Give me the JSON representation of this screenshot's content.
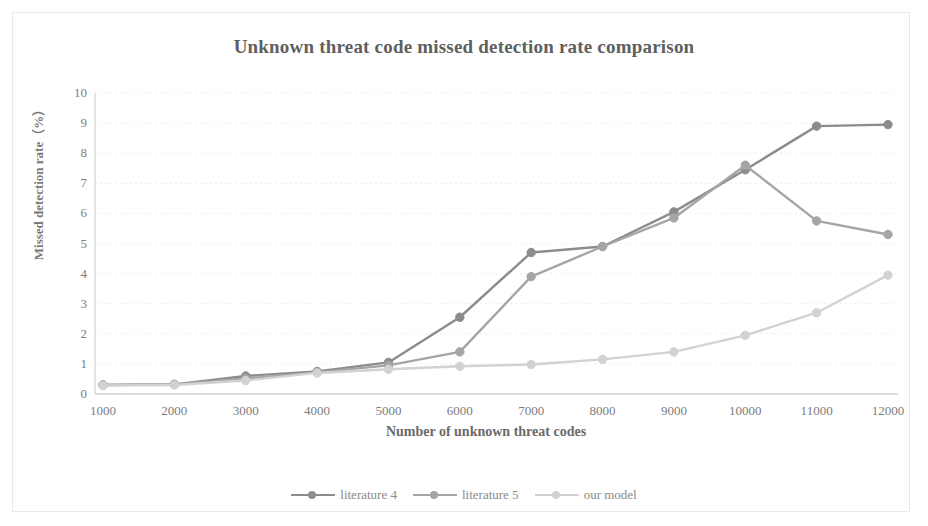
{
  "chart_data": {
    "type": "line",
    "title": "Unknown threat code missed detection rate comparison",
    "xlabel": "Number of unknown threat codes",
    "ylabel": "Missed detection rate（%）",
    "categories": [
      1000,
      2000,
      3000,
      4000,
      5000,
      6000,
      7000,
      8000,
      9000,
      10000,
      11000,
      12000
    ],
    "x_tick_labels": [
      "1000",
      "2000",
      "3000",
      "4000",
      "5000",
      "6000",
      "7000",
      "8000",
      "9000",
      "10000",
      "11000",
      "12000"
    ],
    "y_tick_labels": [
      "0",
      "1",
      "2",
      "3",
      "4",
      "5",
      "6",
      "7",
      "8",
      "9",
      "10"
    ],
    "xlim": [
      1000,
      12000
    ],
    "ylim": [
      0,
      10
    ],
    "grid": true,
    "grid_axis": "y",
    "legend_position": "bottom",
    "series": [
      {
        "name": "literature 4",
        "color": "#8c8c8c",
        "values": [
          0.3,
          0.32,
          0.6,
          0.75,
          1.05,
          2.55,
          4.7,
          4.9,
          6.05,
          7.45,
          8.9,
          8.95
        ]
      },
      {
        "name": "literature 5",
        "color": "#a5a5a5",
        "values": [
          0.3,
          0.32,
          0.52,
          0.72,
          0.95,
          1.4,
          3.9,
          4.9,
          5.85,
          7.6,
          5.75,
          5.3
        ]
      },
      {
        "name": "our model",
        "color": "#d2d2d2",
        "values": [
          0.28,
          0.3,
          0.45,
          0.7,
          0.82,
          0.92,
          0.98,
          1.15,
          1.4,
          1.95,
          2.7,
          3.95
        ]
      }
    ]
  },
  "legend": {
    "items": [
      {
        "label": "literature 4",
        "color": "#8c8c8c"
      },
      {
        "label": "literature 5",
        "color": "#a5a5a5"
      },
      {
        "label": "our model",
        "color": "#d2d2d2"
      }
    ]
  }
}
